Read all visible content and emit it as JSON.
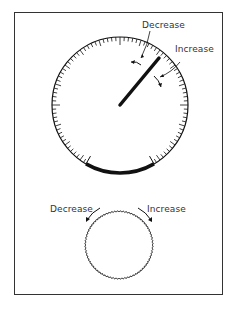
{
  "diagram": {
    "dial": {
      "labels": {
        "decrease": "Decrease",
        "increase": "Increase"
      },
      "needle_angle_deg": 40,
      "tick_count": 100,
      "highlighted_arc": "bottom range band"
    },
    "knob": {
      "labels": {
        "decrease": "Decrease",
        "increase": "Increase"
      },
      "style": "knurled edge"
    },
    "colors": {
      "line": "#111111",
      "text": "#333333",
      "background": "#ffffff"
    }
  }
}
